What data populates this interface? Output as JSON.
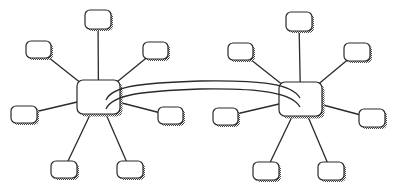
{
  "diagram": {
    "type": "network-topology",
    "colors": {
      "background": "#ffffff",
      "stroke": "#2a2a2a",
      "shadow": "#6e6e6e",
      "node_fill": "#ffffff"
    },
    "hubs": [
      {
        "id": "hub-left",
        "x": 77,
        "y": 80,
        "w": 43,
        "h": 34
      },
      {
        "id": "hub-right",
        "x": 279,
        "y": 82,
        "w": 43,
        "h": 34
      }
    ],
    "nodes": [
      {
        "id": "L-top",
        "hub": "hub-left",
        "x": 85,
        "y": 10,
        "w": 26,
        "h": 19
      },
      {
        "id": "L-upper-left",
        "hub": "hub-left",
        "x": 26,
        "y": 41,
        "w": 25,
        "h": 17
      },
      {
        "id": "L-upper-right",
        "hub": "hub-left",
        "x": 143,
        "y": 42,
        "w": 25,
        "h": 17
      },
      {
        "id": "L-left",
        "hub": "hub-left",
        "x": 11,
        "y": 106,
        "w": 26,
        "h": 17
      },
      {
        "id": "L-right",
        "hub": "hub-left",
        "x": 158,
        "y": 107,
        "w": 25,
        "h": 17
      },
      {
        "id": "L-bottom-left",
        "hub": "hub-left",
        "x": 51,
        "y": 161,
        "w": 26,
        "h": 17
      },
      {
        "id": "L-bottom-right",
        "hub": "hub-left",
        "x": 117,
        "y": 161,
        "w": 26,
        "h": 17
      },
      {
        "id": "R-top",
        "hub": "hub-right",
        "x": 286,
        "y": 12,
        "w": 26,
        "h": 19
      },
      {
        "id": "R-upper-left",
        "hub": "hub-right",
        "x": 228,
        "y": 43,
        "w": 25,
        "h": 17
      },
      {
        "id": "R-upper-right",
        "hub": "hub-right",
        "x": 344,
        "y": 43,
        "w": 26,
        "h": 18
      },
      {
        "id": "R-left",
        "hub": "hub-right",
        "x": 213,
        "y": 108,
        "w": 25,
        "h": 17
      },
      {
        "id": "R-right",
        "hub": "hub-right",
        "x": 359,
        "y": 109,
        "w": 26,
        "h": 18
      },
      {
        "id": "R-bottom-left",
        "hub": "hub-right",
        "x": 253,
        "y": 162,
        "w": 26,
        "h": 18
      },
      {
        "id": "R-bottom-right",
        "hub": "hub-right",
        "x": 318,
        "y": 162,
        "w": 26,
        "h": 18
      }
    ],
    "trunks": [
      {
        "id": "trunk-upper",
        "d": "M106,100 C112,86 140,83 200,81 C262,80 292,84 300,98"
      },
      {
        "id": "trunk-lower",
        "d": "M106,109 C112,95 140,91 200,89 C262,88 292,93 300,107"
      }
    ]
  }
}
